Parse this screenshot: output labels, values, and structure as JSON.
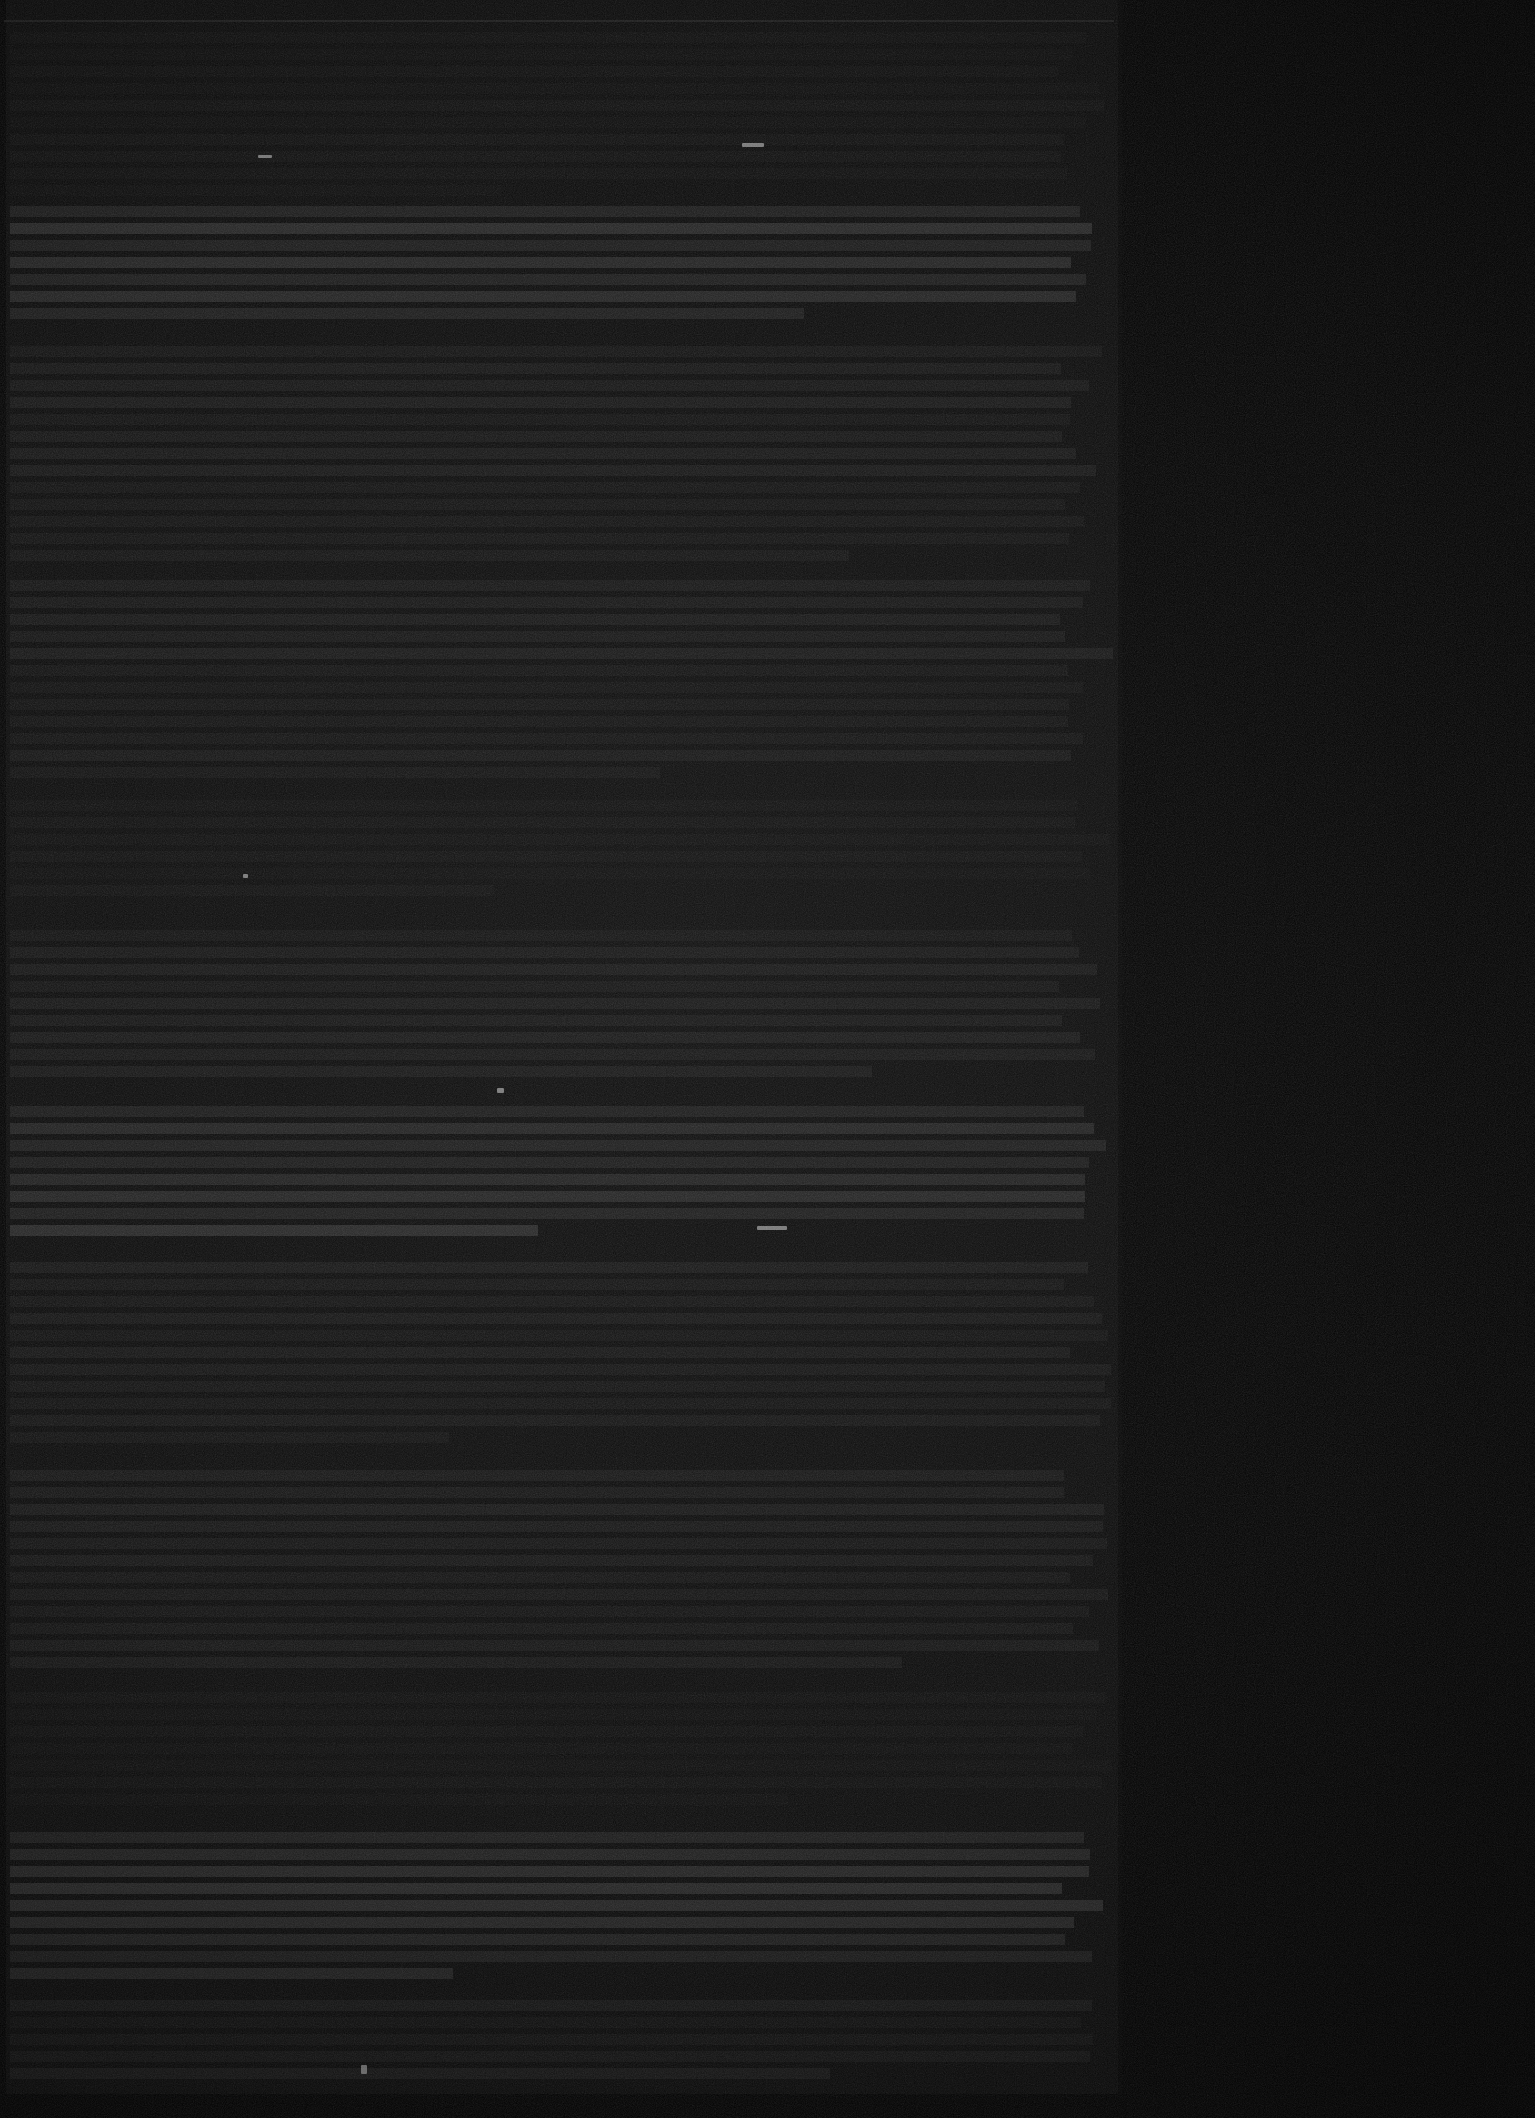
{
  "document": {
    "kind": "scanned-page",
    "legible_text": "",
    "note": "No legible text is present in the pixels; the scan is severely underexposed and all glyph detail is lost in sensor noise."
  },
  "canvas": {
    "width": 1535,
    "height": 2118,
    "background_color": "#000000"
  },
  "page": {
    "left": 0,
    "top": 0,
    "width": 1122,
    "height": 2106,
    "background_color": "#080808",
    "border_color": "#000000",
    "left_border_width": 6,
    "bottom_border_height": 12,
    "right_border_width": 4
  },
  "right_margin": {
    "left": 1122,
    "width": 413,
    "color": "#000000"
  },
  "header_rule": {
    "left": 4,
    "top": 20,
    "width": 1110,
    "height": 2,
    "color": "#2a2a2a"
  },
  "colors": {
    "page_base": "#080808",
    "text_line": "#141414",
    "text_line_bright": "#242424",
    "text_line_dim": "#0e0e0e",
    "speck": "#9a9a9a",
    "void": "#000000"
  },
  "text_blocks": [
    {
      "top": 32,
      "lines": 10,
      "emphasis": "dim"
    },
    {
      "top": 206,
      "lines": 7,
      "emphasis": "bright"
    },
    {
      "top": 346,
      "lines": 13,
      "emphasis": "normal"
    },
    {
      "top": 580,
      "lines": 12,
      "emphasis": "normal"
    },
    {
      "top": 800,
      "lines": 6,
      "emphasis": "dim"
    },
    {
      "top": 930,
      "lines": 9,
      "emphasis": "normal"
    },
    {
      "top": 1106,
      "lines": 8,
      "emphasis": "bright"
    },
    {
      "top": 1262,
      "lines": 11,
      "emphasis": "normal"
    },
    {
      "top": 1470,
      "lines": 12,
      "emphasis": "normal"
    },
    {
      "top": 1692,
      "lines": 7,
      "emphasis": "dim"
    },
    {
      "top": 1832,
      "lines": 9,
      "emphasis": "bright"
    },
    {
      "top": 2000,
      "lines": 5,
      "emphasis": "normal"
    }
  ],
  "specks": [
    {
      "left": 258,
      "top": 155,
      "width": 14,
      "height": 3
    },
    {
      "left": 742,
      "top": 143,
      "width": 22,
      "height": 4
    },
    {
      "left": 497,
      "top": 1088,
      "width": 7,
      "height": 5
    },
    {
      "left": 757,
      "top": 1226,
      "width": 30,
      "height": 4
    },
    {
      "left": 243,
      "top": 874,
      "width": 5,
      "height": 4
    },
    {
      "left": 361,
      "top": 2065,
      "width": 6,
      "height": 9
    }
  ]
}
